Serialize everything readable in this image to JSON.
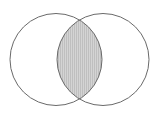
{
  "figure": {
    "name": "venn-diagram",
    "canvas": {
      "width": 160,
      "height": 123,
      "background_color": "#ffffff"
    }
  },
  "chart_data": {
    "type": "diagram",
    "diagram_type": "venn",
    "title": "",
    "xlabel": "",
    "ylabel": "",
    "set_count": 2,
    "labels_visible": false,
    "sets": [
      {
        "id": "left-set",
        "label": "",
        "center_x": 56,
        "center_y": 59.5,
        "radius": 46,
        "fill_color": "#ffffff",
        "stroke_color": "#6a6a6a",
        "stroke_width": 1
      },
      {
        "id": "right-set",
        "label": "",
        "center_x": 103,
        "center_y": 59.5,
        "radius": 46,
        "fill_color": "#ffffff",
        "stroke_color": "#6a6a6a",
        "stroke_width": 1
      }
    ],
    "intersection": {
      "id": "intersection-region",
      "label": "",
      "shaded": true,
      "fill_color": "#d4d4d4",
      "hatch_color": "#bfbfbf",
      "hatch_pattern": "vertical-lines",
      "hatch_spacing_px": 2,
      "stroke_color": "#6a6a6a",
      "stroke_width": 1,
      "left_x": 54,
      "right_x": 105,
      "top_point_x": 79.5,
      "top_point_y": 10,
      "bottom_point_x": 79.5,
      "bottom_point_y": 109
    },
    "colors": {
      "stroke": "#6a6a6a",
      "shade_fill": "#d4d4d4",
      "hatch": "#bfbfbf",
      "background": "#ffffff"
    }
  }
}
